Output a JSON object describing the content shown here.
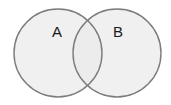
{
  "diagram": {
    "type": "venn",
    "sets": [
      {
        "id": "A",
        "label": "A",
        "cx": 58,
        "cy": 53,
        "r": 44,
        "label_x": 57,
        "label_y": 37
      },
      {
        "id": "B",
        "label": "B",
        "cx": 117,
        "cy": 53,
        "r": 44,
        "label_x": 118,
        "label_y": 37
      }
    ],
    "colors": {
      "fill": "#ebebeb",
      "stroke": "#7c7c7c",
      "background": "#ffffff"
    }
  }
}
